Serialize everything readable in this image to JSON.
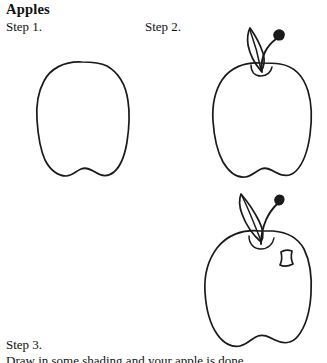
{
  "document": {
    "title": "Apples",
    "type": "drawing-tutorial",
    "background_color": "#ffffff",
    "ink_color": "#1a1a1a"
  },
  "steps": [
    {
      "label": "Step 1.",
      "figure_name": "apple-outline",
      "description": "Plain apple body outline with notched bottom"
    },
    {
      "label": "Step 2.",
      "figure_name": "apple-with-stem-and-leaf",
      "description": "Apple body with curved stem, bud knob and one leaf"
    },
    {
      "label": "Step 3.",
      "figure_name": "apple-with-highlight",
      "description": "Apple with stem, leaf and small highlight shine mark"
    }
  ],
  "cut_off_text": {
    "value": "Draw in some shading and your apple is done.",
    "note": "clipped at bottom edge of page"
  }
}
